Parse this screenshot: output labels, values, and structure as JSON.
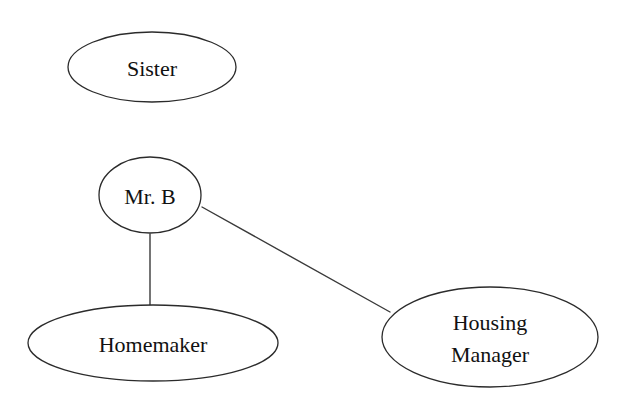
{
  "diagram": {
    "type": "ecomap",
    "background_color": "#ffffff",
    "stroke_color": "#2b2b2b",
    "edge_color": "#3a3a3a",
    "text_color": "#111111",
    "nodes": [
      {
        "id": "sister",
        "label": "Sister",
        "shape": "ellipse",
        "cx": 152,
        "cy": 67,
        "rx": 84,
        "ry": 35,
        "lines": [
          "Sister"
        ]
      },
      {
        "id": "mr-b",
        "label": "Mr. B",
        "shape": "ellipse",
        "cx": 150,
        "cy": 195,
        "rx": 51,
        "ry": 38,
        "lines": [
          "Mr. B"
        ]
      },
      {
        "id": "homemaker",
        "label": "Homemaker",
        "shape": "ellipse",
        "cx": 153,
        "cy": 343,
        "rx": 125,
        "ry": 38,
        "lines": [
          "Homemaker"
        ]
      },
      {
        "id": "housing-manager",
        "label": "Housing Manager",
        "shape": "ellipse",
        "cx": 490,
        "cy": 337,
        "rx": 108,
        "ry": 50,
        "lines": [
          "Housing",
          "Manager"
        ]
      }
    ],
    "edges": [
      {
        "id": "edge-mrb-homemaker",
        "from": "mr-b",
        "to": "homemaker",
        "style": "solid",
        "x1": 150,
        "y1": 234,
        "x2": 150,
        "y2": 305
      },
      {
        "id": "edge-mrb-housing-manager",
        "from": "mr-b",
        "to": "housing-manager",
        "style": "solid",
        "x1": 202,
        "y1": 207,
        "x2": 390,
        "y2": 312
      }
    ]
  }
}
